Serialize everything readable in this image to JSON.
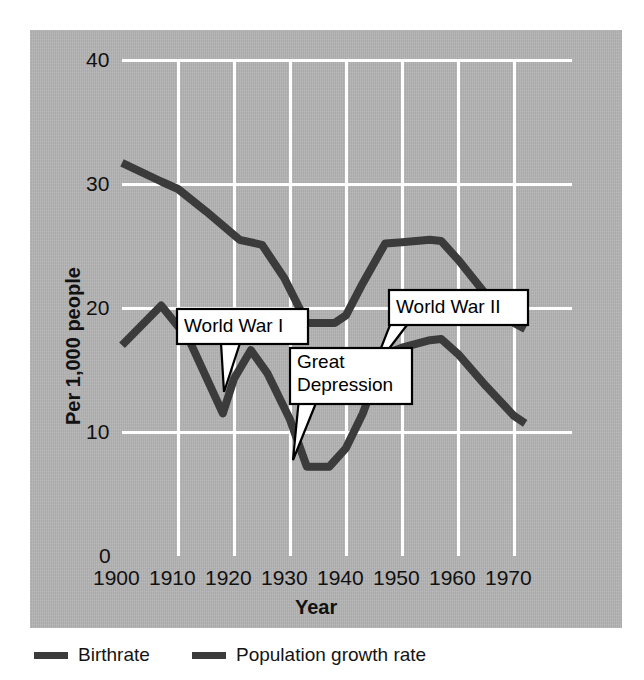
{
  "chart_data": {
    "type": "line",
    "title": "",
    "xlabel": "Year",
    "ylabel": "Per 1,000 people",
    "xlim": [
      1900,
      1972
    ],
    "ylim": [
      0,
      40
    ],
    "xticks": [
      1900,
      1910,
      1920,
      1930,
      1940,
      1950,
      1960,
      1970
    ],
    "xtick_labels": [
      "1900",
      "1910",
      "1920",
      "1930",
      "1940",
      "1950",
      "1960",
      "1970"
    ],
    "yticks": [
      0,
      10,
      20,
      30,
      40
    ],
    "ytick_labels": [
      "0",
      "10",
      "20",
      "30",
      "40"
    ],
    "grid": true,
    "grid_color": "#ffffff",
    "plot_background": "#b4b4b4",
    "line_color": "#3b3b3b",
    "legend_position": "below",
    "series": [
      {
        "name": "Birthrate",
        "x": [
          1900,
          1907,
          1910,
          1915,
          1921,
          1925,
          1929,
          1933,
          1938,
          1940,
          1943,
          1947,
          1950,
          1955,
          1957,
          1960,
          1965,
          1970,
          1972
        ],
        "values": [
          31.7,
          30.2,
          29.6,
          27.8,
          25.5,
          25.1,
          22.4,
          18.8,
          18.8,
          19.4,
          22.0,
          25.2,
          25.3,
          25.5,
          25.4,
          23.9,
          21.1,
          18.8,
          18.3
        ]
      },
      {
        "name": "Population growth rate",
        "x": [
          1900,
          1907,
          1912,
          1918,
          1920,
          1923,
          1926,
          1930,
          1933,
          1937,
          1940,
          1943,
          1947,
          1950,
          1955,
          1957,
          1960,
          1965,
          1970,
          1972
        ],
        "values": [
          17.0,
          20.2,
          17.4,
          11.5,
          14.3,
          16.6,
          14.7,
          11.0,
          7.2,
          7.2,
          8.7,
          11.5,
          16.3,
          16.8,
          17.4,
          17.5,
          16.3,
          13.7,
          11.3,
          10.7
        ]
      }
    ],
    "annotations": [
      {
        "label": "World War I",
        "lines": [
          "World War I"
        ],
        "points_to_year": 1918,
        "points_to_value": 11.5
      },
      {
        "label": "Great Depression",
        "lines": [
          "Great",
          "Depression"
        ],
        "points_to_year": 1933,
        "points_to_value": 7.2
      },
      {
        "label": "World War II",
        "lines": [
          "World War II"
        ],
        "points_to_year": 1943,
        "points_to_value": 11.5
      }
    ]
  },
  "legend": {
    "items": [
      {
        "label": "Birthrate"
      },
      {
        "label": "Population growth rate"
      }
    ]
  },
  "axes": {
    "y_title": "Per 1,000 people",
    "x_title": "Year",
    "y_tick_0": "0",
    "y_tick_10": "10",
    "y_tick_20": "20",
    "y_tick_30": "30",
    "y_tick_40": "40",
    "x_tick_1900": "1900",
    "x_tick_1910": "1910",
    "x_tick_1920": "1920",
    "x_tick_1930": "1930",
    "x_tick_1940": "1940",
    "x_tick_1950": "1950",
    "x_tick_1960": "1960",
    "x_tick_1970": "1970"
  },
  "annotations": {
    "ww1": "World War I",
    "great_line1": "Great",
    "great_line2": "Depression",
    "ww2": "World War II"
  }
}
